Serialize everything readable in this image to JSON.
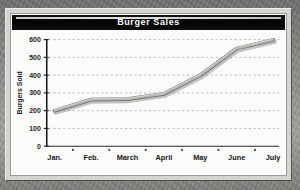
{
  "chart_data": {
    "type": "line",
    "title": "Burger Sales",
    "xlabel": "",
    "ylabel": "Burgers Sold",
    "categories": [
      "Jan.",
      "Feb.",
      "March",
      "April",
      "May",
      "June",
      "July"
    ],
    "values": [
      200,
      262,
      265,
      295,
      400,
      550,
      598
    ],
    "series": [
      {
        "name": "Burgers Sold",
        "values": [
          200,
          262,
          265,
          295,
          400,
          550,
          598
        ]
      }
    ],
    "ylim": [
      0,
      600
    ],
    "yticks": [
      0,
      100,
      200,
      300,
      400,
      500,
      600
    ],
    "ytick_labels": [
      "0",
      "100",
      "200",
      "300",
      "400",
      "500",
      "600"
    ],
    "grid": "horizontal-dashed",
    "legend": "none",
    "line_color": "#9a9a96",
    "line_edge_color": "#5d5d59",
    "axis_color": "#1d1d1d",
    "grid_color": "#a9a9a5",
    "plot_background": "#fbfbfa",
    "title_bar_color": "#070707",
    "title_text_color": "#ffffff",
    "frame_color": "#d4d4d1"
  },
  "chart": {
    "title": "Burger Sales",
    "y_axis_title": "Burgers Sold"
  }
}
